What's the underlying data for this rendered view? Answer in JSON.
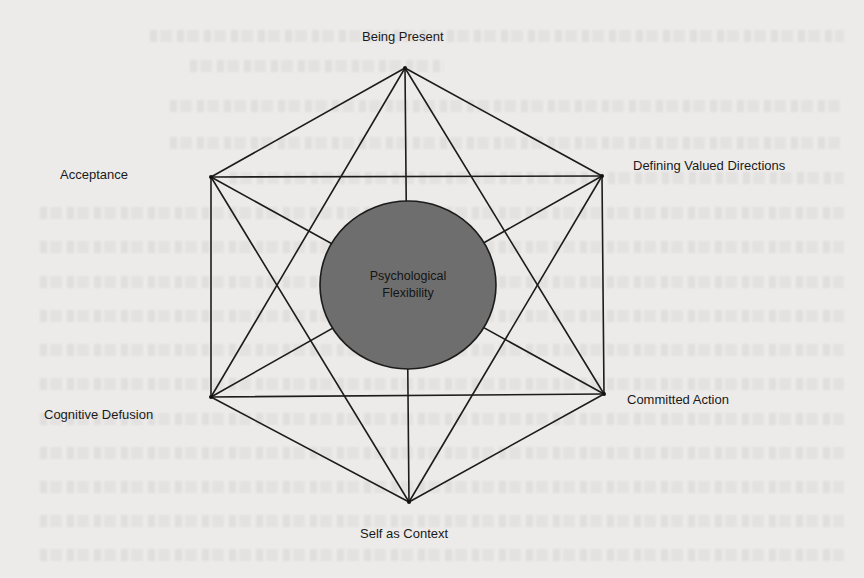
{
  "diagram": {
    "center": {
      "line1": "Psychological",
      "line2": "Flexibility",
      "fill": "#6e6e6e"
    },
    "nodes": [
      {
        "id": "being-present",
        "label": "Being Present",
        "x": 405,
        "y": 68
      },
      {
        "id": "defining-valued-directions",
        "label": "Defining Valued Directions",
        "x": 602,
        "y": 176
      },
      {
        "id": "committed-action",
        "label": "Committed Action",
        "x": 604,
        "y": 394
      },
      {
        "id": "self-as-context",
        "label": "Self as Context",
        "x": 409,
        "y": 502
      },
      {
        "id": "cognitive-defusion",
        "label": "Cognitive Defusion",
        "x": 211,
        "y": 397
      },
      {
        "id": "acceptance",
        "label": "Acceptance",
        "x": 211,
        "y": 177
      }
    ],
    "edges": "every node connected to every other node (complete graph)",
    "line_color": "#1c1c1c",
    "background_color": "#ecebe9"
  }
}
